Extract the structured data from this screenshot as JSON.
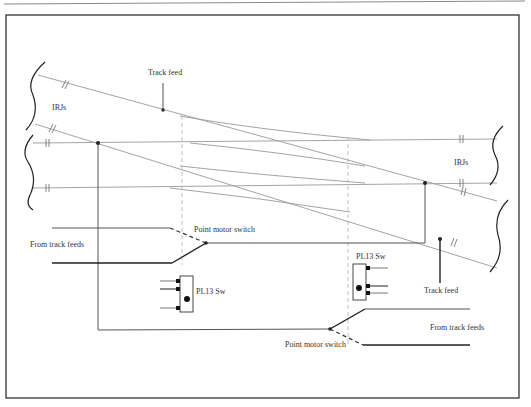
{
  "diagram": {
    "type": "wiring-diagram",
    "colors": {
      "track": "#9a9a9a",
      "wire": "#555555",
      "frame": "#333333",
      "text": "#333333"
    },
    "labels": {
      "track_feed_top": "Track feed",
      "track_feed_bottom": "Track feed",
      "irjs_left": "IRJs",
      "irjs_right": "IRJs",
      "from_track_feeds_left": "From track feeds",
      "from_track_feeds_right": "From track feeds",
      "point_motor_switch_left": "Point motor switch",
      "point_motor_switch_right": "Point motor switch",
      "switch_left": "PL13 Sw",
      "switch_right": "PL13 Sw"
    },
    "nodes": [
      {
        "id": "track-feed-top",
        "x": 163,
        "y": 110
      },
      {
        "id": "feed-junction-left",
        "x": 98,
        "y": 143
      },
      {
        "id": "feed-junction-right",
        "x": 425,
        "y": 183
      },
      {
        "id": "track-feed-bottom",
        "x": 440,
        "y": 239
      },
      {
        "id": "pms-left-pivot",
        "x": 206,
        "y": 243
      },
      {
        "id": "pms-right-pivot",
        "x": 330,
        "y": 329
      }
    ]
  }
}
